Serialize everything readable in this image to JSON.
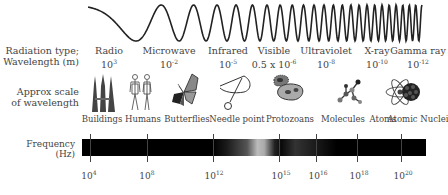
{
  "wave": {
    "icon": "sine-wave-decreasing-wavelength"
  },
  "row_labels": {
    "radiation_line1": "Radiation type;",
    "radiation_line2": "Wavelength (m)",
    "scale_line1": "Approx scale",
    "scale_line2": "of wavelength",
    "frequency_line1": "Frequency",
    "frequency_line2": "(Hz)"
  },
  "radiation_types": [
    {
      "name": "Radio",
      "wavelength_base": "10",
      "wavelength_exp": "3"
    },
    {
      "name": "Microwave",
      "wavelength_base": "10",
      "wavelength_exp": "-2"
    },
    {
      "name": "Infrared",
      "wavelength_base": "10",
      "wavelength_exp": "-5"
    },
    {
      "name": "Visible",
      "wavelength_base": "0.5 x 10",
      "wavelength_exp": "-6"
    },
    {
      "name": "Ultraviolet",
      "wavelength_base": "10",
      "wavelength_exp": "-8"
    },
    {
      "name": "X-ray",
      "wavelength_base": "10",
      "wavelength_exp": "-10"
    },
    {
      "name": "Gamma ray",
      "wavelength_base": "10",
      "wavelength_exp": "-12"
    }
  ],
  "scale_objects": [
    {
      "label": "Buildings",
      "icon": "buildings-icon"
    },
    {
      "label": "Humans",
      "icon": "humans-icon"
    },
    {
      "label": "Butterflies",
      "icon": "butterfly-icon"
    },
    {
      "label": "Needle point",
      "icon": "needle-icon"
    },
    {
      "label": "Protozoans",
      "icon": "protozoa-icon"
    },
    {
      "label": "Molecules",
      "icon": "molecule-icon"
    },
    {
      "label": "Atoms",
      "icon": "atom-icon"
    },
    {
      "label": "Atomic Nuclei",
      "icon": "nucleus-icon"
    }
  ],
  "frequency_ticks": [
    {
      "base": "10",
      "exp": "4"
    },
    {
      "base": "10",
      "exp": "8"
    },
    {
      "base": "10",
      "exp": "12"
    },
    {
      "base": "10",
      "exp": "15"
    },
    {
      "base": "10",
      "exp": "16"
    },
    {
      "base": "10",
      "exp": "18"
    },
    {
      "base": "10",
      "exp": "20"
    }
  ]
}
